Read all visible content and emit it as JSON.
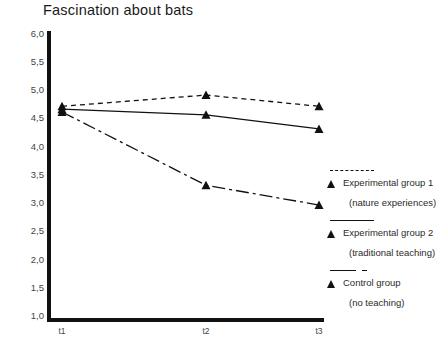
{
  "chart_data": {
    "type": "line",
    "title": "Fascination about bats",
    "xlabel": "",
    "ylabel": "",
    "categories": [
      "t1",
      "t2",
      "t3"
    ],
    "ylim": [
      1.0,
      6.0
    ],
    "ytick_step": 0.5,
    "ytick_labels": [
      "6,0",
      "5,5",
      "5,0",
      "4,5",
      "4,0",
      "3,5",
      "3,0",
      "2,5",
      "2,0",
      "1,5",
      "1,0"
    ],
    "ytick_values": [
      6.0,
      5.5,
      5.0,
      4.5,
      4.0,
      3.5,
      3.0,
      2.5,
      2.0,
      1.5,
      1.0
    ],
    "grid": false,
    "legend_position": "right",
    "decimal_separator": ",",
    "series": [
      {
        "name": "Experimental group 1",
        "sublabel": "(nature experiences)",
        "linestyle": "dotted",
        "marker": "triangle",
        "color": "#111111",
        "values": [
          4.7,
          4.9,
          4.7
        ]
      },
      {
        "name": "Experimental group 2",
        "sublabel": "(traditional teaching)",
        "linestyle": "solid",
        "marker": "triangle",
        "color": "#111111",
        "values": [
          4.65,
          4.55,
          4.3
        ]
      },
      {
        "name": "Control group",
        "sublabel": "(no teaching)",
        "linestyle": "dashdot",
        "marker": "triangle",
        "color": "#111111",
        "values": [
          4.6,
          3.3,
          2.95
        ]
      }
    ]
  },
  "legend": {
    "entries": [
      {
        "key_style": "dotted",
        "label": "Experimental group 1",
        "sublabel": "(nature experiences)"
      },
      {
        "key_style": "solid",
        "label": "Experimental group 2",
        "sublabel": "(traditional teaching)"
      },
      {
        "key_style": "dashdot",
        "label": "Control group",
        "sublabel": "(no teaching)"
      }
    ]
  }
}
